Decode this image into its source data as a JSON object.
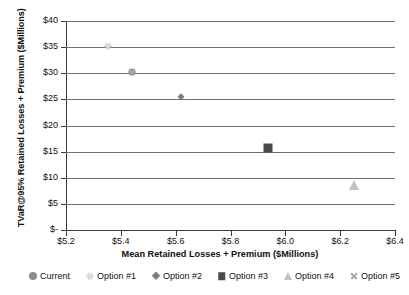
{
  "chart_data": {
    "type": "scatter",
    "title": "",
    "xlabel": "Mean Retained Losses + Premium ($Millions)",
    "ylabel": "TVaR@95% Retained Losses + Premium ($Millions)",
    "xlim": [
      5.2,
      6.4
    ],
    "ylim": [
      0,
      40
    ],
    "grid": true,
    "legend_position": "bottom",
    "xticks": [
      "$5.2",
      "$5.4",
      "$5.6",
      "$5.8",
      "$6.0",
      "$6.2",
      "$6.4"
    ],
    "xtick_values": [
      5.2,
      5.4,
      5.6,
      5.8,
      6.0,
      6.2,
      6.4
    ],
    "yticks": [
      "$-",
      "$5",
      "$10",
      "$15",
      "$20",
      "$25",
      "$30",
      "$35",
      "$40"
    ],
    "ytick_values": [
      0,
      5,
      10,
      15,
      20,
      25,
      30,
      35,
      40
    ],
    "series": [
      {
        "name": "Current",
        "marker": "circle",
        "color": "#8c8c8c",
        "size": 7,
        "points": [
          {
            "x": 5.442,
            "y": 30.3
          }
        ]
      },
      {
        "name": "Option #1",
        "marker": "asterisk",
        "color": "#d8d8d8",
        "size": 8,
        "points": [
          {
            "x": 5.352,
            "y": 35.2
          }
        ]
      },
      {
        "name": "Option #2",
        "marker": "diamond",
        "color": "#7d7d7d",
        "size": 7,
        "points": [
          {
            "x": 5.618,
            "y": 25.4
          }
        ]
      },
      {
        "name": "Option #3",
        "marker": "square",
        "color": "#4a4a4a",
        "size": 9,
        "points": [
          {
            "x": 5.938,
            "y": 15.7
          }
        ]
      },
      {
        "name": "Option #4",
        "marker": "triangle",
        "color": "#c2c2c2",
        "size": 10,
        "points": [
          {
            "x": 6.252,
            "y": 8.7
          }
        ]
      },
      {
        "name": "Option #5",
        "marker": "cross",
        "color": "#a8a8a8",
        "size": 8,
        "points": [
          {
            "x": 5.442,
            "y": 30.3
          }
        ]
      }
    ]
  },
  "legend": {
    "items": [
      {
        "label": "Current",
        "marker": "circle",
        "color": "#8c8c8c"
      },
      {
        "label": "Option #1",
        "marker": "asterisk",
        "color": "#d8d8d8"
      },
      {
        "label": "Option #2",
        "marker": "diamond",
        "color": "#7d7d7d"
      },
      {
        "label": "Option #3",
        "marker": "square",
        "color": "#4a4a4a"
      },
      {
        "label": "Option #4",
        "marker": "triangle",
        "color": "#c2c2c2"
      },
      {
        "label": "Option #5",
        "marker": "cross",
        "color": "#a8a8a8"
      }
    ]
  },
  "style": {
    "gridline_color": "#6e6e6e",
    "axis_color": "#3a3a3a",
    "text_color": "#111111",
    "background": "#ffffff"
  }
}
